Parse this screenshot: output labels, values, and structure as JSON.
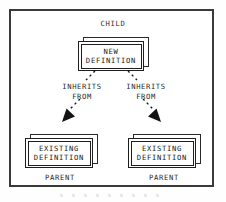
{
  "diagram": {
    "type": "inheritance-diagram",
    "title_text": "CHILD",
    "frame": {
      "border_color": "#3a3a3a",
      "background": "#ffffff"
    },
    "labels": {
      "child": "CHILD",
      "parent_left": "PARENT",
      "parent_right": "PARENT"
    },
    "nodes": [
      {
        "id": "new-definition",
        "role": "child",
        "line1": "NEW",
        "line2": "DEFINITION",
        "style": "stacked-box"
      },
      {
        "id": "existing-definition-left",
        "role": "parent",
        "line1": "EXISTING",
        "line2": "DEFINITION",
        "style": "stacked-box"
      },
      {
        "id": "existing-definition-right",
        "role": "parent",
        "line1": "EXISTING",
        "line2": "DEFINITION",
        "style": "stacked-box"
      }
    ],
    "edges": [
      {
        "id": "edge-left",
        "from": "new-definition",
        "to": "existing-definition-left",
        "label_line1": "INHERITS",
        "label_line2": "FROM",
        "stroke": "dashed",
        "arrowhead": "filled-triangle",
        "color": "#1a1a1a"
      },
      {
        "id": "edge-right",
        "from": "new-definition",
        "to": "existing-definition-right",
        "label_line1": "INHERITS",
        "label_line2": "FROM",
        "stroke": "dashed",
        "arrowhead": "filled-triangle",
        "color": "#1a1a1a"
      }
    ],
    "colors": {
      "ink": "#1a1a1a",
      "frame": "#3a3a3a",
      "paper": "#ffffff"
    }
  }
}
